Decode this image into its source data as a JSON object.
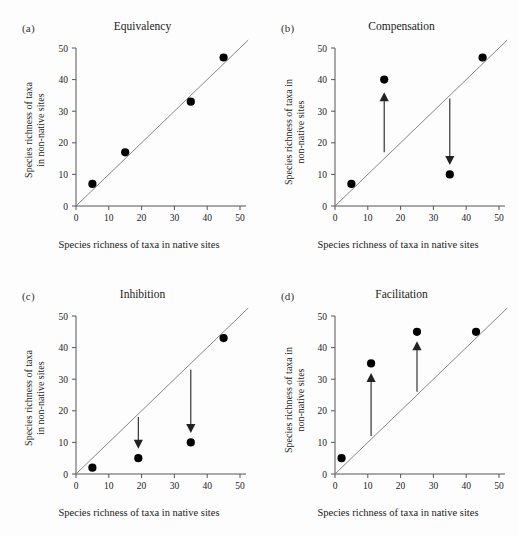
{
  "figure": {
    "background_color": "#fdfdfd",
    "axis_color": "#555555",
    "line_color": "#777777",
    "marker_color": "#000000",
    "arrow_color": "#222222",
    "axis": {
      "x_min": 0,
      "x_max": 50,
      "y_min": 0,
      "y_max": 50,
      "x_ticks": [
        "0",
        "10",
        "20",
        "30",
        "40",
        "50"
      ],
      "y_ticks": [
        "0",
        "10",
        "20",
        "30",
        "40",
        "50"
      ],
      "x_tick_values": [
        0,
        10,
        20,
        30,
        40,
        50
      ],
      "y_tick_values": [
        0,
        10,
        20,
        30,
        40,
        50
      ],
      "xlabel": "Species richness of taxa in native sites",
      "ylabel_line1": "Species richness of taxa",
      "ylabel_line2": "in non-native sites",
      "ylabel_b_line1": "Species richness of taxa in",
      "ylabel_b_line2": "non-native sites"
    }
  },
  "panels": [
    {
      "letter": "(a)",
      "title": "Equivalency",
      "ylabel_style": "two-line-a"
    },
    {
      "letter": "(b)",
      "title": "Compensation",
      "ylabel_style": "two-line-b"
    },
    {
      "letter": "(c)",
      "title": "Inhibition",
      "ylabel_style": "two-line-a"
    },
    {
      "letter": "(d)",
      "title": "Facilitation",
      "ylabel_style": "two-line-b"
    }
  ],
  "chart_data": [
    {
      "type": "scatter",
      "panel": "a",
      "title": "Equivalency",
      "xlabel": "Species richness of taxa in native sites",
      "ylabel": "Species richness of taxa in non-native sites",
      "xlim": [
        0,
        50
      ],
      "ylim": [
        0,
        50
      ],
      "grid": false,
      "legend": "none",
      "reference_line": {
        "type": "1:1 line",
        "from": [
          0,
          0
        ],
        "to": [
          50,
          50
        ]
      },
      "points": [
        {
          "x": 5,
          "y": 7
        },
        {
          "x": 15,
          "y": 17
        },
        {
          "x": 35,
          "y": 33
        },
        {
          "x": 45,
          "y": 47
        }
      ],
      "arrows": []
    },
    {
      "type": "scatter",
      "panel": "b",
      "title": "Compensation",
      "xlabel": "Species richness of taxa in native sites",
      "ylabel": "Species richness of taxa in non-native sites",
      "xlim": [
        0,
        50
      ],
      "ylim": [
        0,
        50
      ],
      "grid": false,
      "legend": "none",
      "reference_line": {
        "type": "1:1 line",
        "from": [
          0,
          0
        ],
        "to": [
          50,
          50
        ]
      },
      "points": [
        {
          "x": 5,
          "y": 7
        },
        {
          "x": 15,
          "y": 40
        },
        {
          "x": 35,
          "y": 10
        },
        {
          "x": 45,
          "y": 47
        }
      ],
      "arrows": [
        {
          "x": 15,
          "y_from": 17,
          "y_to": 36,
          "direction": "up"
        },
        {
          "x": 35,
          "y_from": 34,
          "y_to": 13,
          "direction": "down"
        }
      ]
    },
    {
      "type": "scatter",
      "panel": "c",
      "title": "Inhibition",
      "xlabel": "Species richness of taxa in native sites",
      "ylabel": "Species richness of taxa in non-native sites",
      "xlim": [
        0,
        50
      ],
      "ylim": [
        0,
        50
      ],
      "grid": false,
      "legend": "none",
      "reference_line": {
        "type": "1:1 line",
        "from": [
          0,
          0
        ],
        "to": [
          50,
          50
        ]
      },
      "points": [
        {
          "x": 5,
          "y": 2
        },
        {
          "x": 19,
          "y": 5
        },
        {
          "x": 35,
          "y": 10
        },
        {
          "x": 45,
          "y": 43
        }
      ],
      "arrows": [
        {
          "x": 19,
          "y_from": 18,
          "y_to": 8,
          "direction": "down"
        },
        {
          "x": 35,
          "y_from": 33,
          "y_to": 13,
          "direction": "down"
        }
      ]
    },
    {
      "type": "scatter",
      "panel": "d",
      "title": "Facilitation",
      "xlabel": "Species richness of taxa in native sites",
      "ylabel": "Species richness of taxa in non-native sites",
      "xlim": [
        0,
        50
      ],
      "ylim": [
        0,
        50
      ],
      "grid": false,
      "legend": "none",
      "reference_line": {
        "type": "1:1 line",
        "from": [
          0,
          0
        ],
        "to": [
          50,
          50
        ]
      },
      "points": [
        {
          "x": 2,
          "y": 5
        },
        {
          "x": 11,
          "y": 35
        },
        {
          "x": 25,
          "y": 45
        },
        {
          "x": 43,
          "y": 45
        }
      ],
      "arrows": [
        {
          "x": 11,
          "y_from": 12,
          "y_to": 32,
          "direction": "up"
        },
        {
          "x": 25,
          "y_from": 26,
          "y_to": 42,
          "direction": "up"
        }
      ]
    }
  ]
}
